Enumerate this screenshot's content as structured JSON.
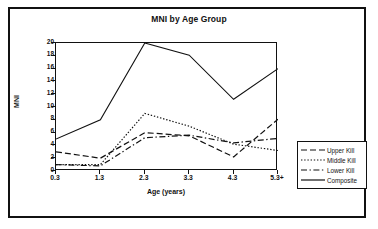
{
  "chart_data": {
    "type": "line",
    "title": "MNI by Age Group",
    "xlabel": "Age (years)",
    "ylabel": "MNI",
    "categories": [
      "0.3",
      "1.3",
      "2.3",
      "3.3",
      "4.3",
      "5.3+"
    ],
    "ylim": [
      0,
      20
    ],
    "yticks": [
      0,
      2,
      4,
      6,
      8,
      10,
      12,
      14,
      16,
      18,
      20
    ],
    "grid": false,
    "legend_position": "right",
    "series": [
      {
        "name": "Upper Kill",
        "style": "dashed",
        "color": "#111111",
        "values": [
          3.0,
          2.0,
          6.0,
          5.5,
          2.2,
          8.1
        ]
      },
      {
        "name": "Middle Kill",
        "style": "dotted",
        "color": "#111111",
        "values": [
          1.0,
          1.0,
          9.0,
          7.0,
          4.2,
          3.2
        ]
      },
      {
        "name": "Lower Kill",
        "style": "dash-dot",
        "color": "#111111",
        "values": [
          1.0,
          0.8,
          5.2,
          5.6,
          4.4,
          5.1
        ]
      },
      {
        "name": "Composite",
        "style": "solid",
        "color": "#111111",
        "values": [
          5.0,
          8.0,
          20.0,
          18.1,
          11.2,
          16.0
        ]
      }
    ]
  },
  "figure": {
    "background": "#ffffff",
    "frame_color": "#111111"
  }
}
